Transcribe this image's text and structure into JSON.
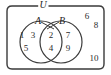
{
  "figure": {
    "type": "venn-diagram",
    "universe_label": "U",
    "set_labels": {
      "left": "A",
      "right": "B"
    },
    "colors": {
      "stroke": "#3a3a3a",
      "text": "#2b2b2b",
      "background": "#ffffff"
    }
  },
  "regions": {
    "a_only": {
      "name": "A only",
      "elements": [
        "1",
        "3",
        "5"
      ],
      "positions": [
        {
          "value": "1",
          "x": 22,
          "y": 35
        },
        {
          "value": "3",
          "x": 33,
          "y": 35
        },
        {
          "value": "5",
          "x": 26,
          "y": 48
        }
      ]
    },
    "intersection": {
      "name": "A and B",
      "elements": [
        "2",
        "4"
      ],
      "positions": [
        {
          "value": "2",
          "x": 51,
          "y": 35
        },
        {
          "value": "4",
          "x": 51,
          "y": 48
        }
      ]
    },
    "b_only": {
      "name": "B only",
      "elements": [
        "7",
        "9"
      ],
      "positions": [
        {
          "value": "7",
          "x": 68,
          "y": 35
        },
        {
          "value": "9",
          "x": 68,
          "y": 48
        }
      ]
    },
    "outside": {
      "name": "Outside A and B",
      "elements": [
        "6",
        "8",
        "10"
      ],
      "positions": [
        {
          "value": "6",
          "x": 87,
          "y": 16
        },
        {
          "value": "8",
          "x": 96,
          "y": 25
        },
        {
          "value": "10",
          "x": 94,
          "y": 58
        }
      ]
    }
  },
  "labels": {
    "universe": {
      "text": "U",
      "x": 43,
      "y": 5
    },
    "a": {
      "text": "A",
      "x": 38,
      "y": 21
    },
    "b": {
      "text": "B",
      "x": 62,
      "y": 21
    }
  }
}
